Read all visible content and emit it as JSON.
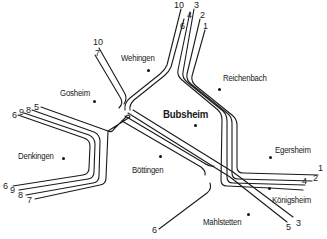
{
  "towns": [
    {
      "id": "wehingen",
      "label": "Wehingen",
      "x": 121,
      "y": 53,
      "dot_x": 148,
      "dot_y": 70,
      "major": false
    },
    {
      "id": "reichenbach",
      "label": "Reichenbach",
      "x": 223,
      "y": 73,
      "dot_x": 219,
      "dot_y": 89,
      "major": false
    },
    {
      "id": "gosheim",
      "label": "Gosheim",
      "x": 60,
      "y": 88,
      "dot_x": 94,
      "dot_y": 101,
      "major": false
    },
    {
      "id": "bubsheim",
      "label": "Bubsheim",
      "x": 163,
      "y": 108,
      "dot_x": 195,
      "dot_y": 125,
      "major": true
    },
    {
      "id": "denkingen",
      "label": "Denkingen",
      "x": 18,
      "y": 151,
      "dot_x": 63,
      "dot_y": 158,
      "major": false
    },
    {
      "id": "boettingen",
      "label": "Böttingen",
      "x": 132,
      "y": 165,
      "dot_x": 160,
      "dot_y": 156,
      "major": false
    },
    {
      "id": "egersheim",
      "label": "Egersheim",
      "x": 275,
      "y": 145,
      "dot_x": 270,
      "dot_y": 157,
      "major": false
    },
    {
      "id": "koenigsheim",
      "label": "Königsheim",
      "x": 272,
      "y": 195,
      "dot_x": 269,
      "dot_y": 188,
      "major": false
    },
    {
      "id": "mahlstetten",
      "label": "Mahlstetten",
      "x": 203,
      "y": 217,
      "dot_x": 248,
      "dot_y": 214,
      "major": false
    }
  ],
  "route_labels": [
    {
      "text": "10",
      "x": 174,
      "y": 1
    },
    {
      "text": "3",
      "x": 194,
      "y": 1
    },
    {
      "text": "4",
      "x": 187,
      "y": 11
    },
    {
      "text": "2",
      "x": 200,
      "y": 11
    },
    {
      "text": "6",
      "x": 180,
      "y": 22
    },
    {
      "text": "1",
      "x": 203,
      "y": 22
    },
    {
      "text": "10",
      "x": 93,
      "y": 38
    },
    {
      "text": "7",
      "x": 95,
      "y": 49
    },
    {
      "text": "6",
      "x": 12,
      "y": 111
    },
    {
      "text": "9",
      "x": 19,
      "y": 108
    },
    {
      "text": "8",
      "x": 26,
      "y": 106
    },
    {
      "text": "5",
      "x": 34,
      "y": 103
    },
    {
      "text": "6",
      "x": 3,
      "y": 182
    },
    {
      "text": "9",
      "x": 10,
      "y": 186
    },
    {
      "text": "8",
      "x": 18,
      "y": 191
    },
    {
      "text": "7",
      "x": 27,
      "y": 196
    },
    {
      "text": "1",
      "x": 318,
      "y": 164
    },
    {
      "text": "2",
      "x": 313,
      "y": 174
    },
    {
      "text": "4",
      "x": 302,
      "y": 177
    },
    {
      "text": "5",
      "x": 286,
      "y": 223
    },
    {
      "text": "3",
      "x": 296,
      "y": 219
    },
    {
      "text": "6",
      "x": 152,
      "y": 226
    }
  ],
  "routes": {
    "from_north_10_6": [
      "M 181 9 L 165 62 L 124 110",
      "M 186 9 L 170 64 L 127 113"
    ],
    "from_north_4_3": [
      "M 191 9 L 182 75 L 225 112 L 228 185 L 260 188 L 310 191",
      "M 195 9 L 186 77 L 230 113 L 233 183 L 295 184"
    ],
    "from_north_2_1": [
      "M 200 19 L 191 79 L 236 114 L 238 178 L 316 179",
      "M 205 30 L 196 81 L 242 116 L 242 173 L 320 173"
    ],
    "from_nw_10_7": [
      "M 103 54 L 130 95 L 132 111",
      "M 98 54 L 124 97"
    ]
  }
}
